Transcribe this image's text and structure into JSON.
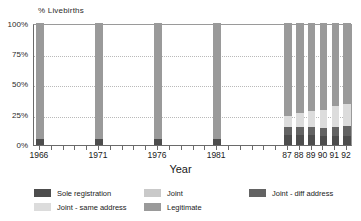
{
  "chart_data": {
    "type": "bar",
    "subtype": "stacked-bar-percent",
    "title": "",
    "xlabel": "Year",
    "ylabel": "% Livebirths",
    "ylim": [
      0,
      100
    ],
    "ytick_labels": [
      "0%",
      "25%",
      "50%",
      "75%",
      "100%"
    ],
    "ytick_values": [
      0,
      25,
      50,
      75,
      100
    ],
    "grid": "horizontal-dotted",
    "legend_position": "bottom",
    "categories": [
      "1966",
      "1971",
      "1976",
      "1981",
      "87",
      "88",
      "89",
      "90",
      "91",
      "92"
    ],
    "series": [
      {
        "name": "Sole registration",
        "color": "#4d4d4d",
        "values": [
          5,
          5,
          5,
          5,
          8,
          8,
          8,
          7,
          7,
          7
        ]
      },
      {
        "name": "Joint - diff address",
        "color": "#636363",
        "values": [
          0,
          0,
          0,
          0,
          7,
          7,
          7,
          7,
          8,
          9
        ]
      },
      {
        "name": "Joint - same address",
        "color": "#dcdcdc",
        "values": [
          0,
          0,
          0,
          0,
          9,
          11,
          13,
          15,
          17,
          18
        ]
      },
      {
        "name": "Joint",
        "color": "#c9c9c9",
        "values": [
          0,
          0,
          0,
          0,
          0,
          0,
          0,
          0,
          0,
          0
        ]
      },
      {
        "name": "Legitimate",
        "color": "#9a9a9a",
        "values": [
          95,
          95,
          95,
          95,
          76,
          74,
          72,
          71,
          68,
          66
        ]
      }
    ],
    "axis": {
      "minor_ticks": true,
      "tick_years": [
        "1966",
        "1967",
        "1968",
        "1969",
        "1970",
        "1971",
        "1972",
        "1973",
        "1974",
        "1975",
        "1976",
        "1977",
        "1978",
        "1979",
        "1980",
        "1981",
        "1982",
        "1983",
        "1984",
        "1985",
        "1986",
        "1987",
        "1988",
        "1989",
        "1990",
        "1991",
        "1992"
      ]
    }
  },
  "legend": {
    "entries": [
      {
        "label": "Sole registration",
        "color": "#4d4d4d"
      },
      {
        "label": "Joint",
        "color": "#c9c9c9"
      },
      {
        "label": "Joint - diff address",
        "color": "#636363"
      },
      {
        "label": "Joint - same address",
        "color": "#dcdcdc"
      },
      {
        "label": "Legitimate",
        "color": "#9a9a9a"
      }
    ]
  },
  "axes": {
    "y_title": "% Livebirths",
    "x_title": "Year",
    "y_labels": [
      "100%",
      "75%",
      "50%",
      "25%",
      "0%"
    ],
    "x_labels": [
      "1966",
      "1971",
      "1976",
      "1981",
      "87",
      "88",
      "89",
      "90",
      "91",
      "92"
    ]
  }
}
